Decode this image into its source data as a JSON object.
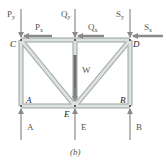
{
  "figure": {
    "caption": "(b)",
    "colors": {
      "member_fill": "#d7dcd9",
      "member_edge": "#9aa39f",
      "force_arrow": "#8a8a8a",
      "weight_highlight": "#6e6e6e",
      "label_text": "#555555",
      "joint_text": "#222222"
    }
  },
  "joints": {
    "C": "C",
    "D": "D",
    "A": "A",
    "B": "B",
    "E": "E"
  },
  "applied_loads": {
    "Py": "P",
    "Py_sub": "y",
    "Px": "P",
    "Px_sub": "x",
    "Qy": "Q",
    "Qy_sub": "y",
    "Qx": "Q",
    "Qx_sub": "x",
    "Sy": "S",
    "Sy_sub": "y",
    "Sx": "S",
    "Sx_sub": "x",
    "W": "W"
  },
  "reactions": {
    "A": "A",
    "E": "E",
    "B": "B"
  }
}
